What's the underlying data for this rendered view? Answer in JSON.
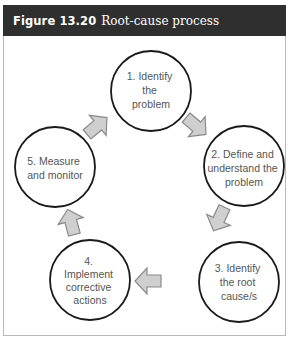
{
  "figure": {
    "label": "Figure 13.20",
    "title": "Root-cause process"
  },
  "colors": {
    "header_bg": "#2f2f2f",
    "header_text": "#ffffff",
    "circle_stroke": "#1a1a1a",
    "arrow_fill": "#cfcfcf",
    "arrow_stroke": "#8a8a8a",
    "node_text": "#555555"
  },
  "nodes": [
    {
      "id": 1,
      "lines": [
        "1. Identify",
        "the",
        "problem"
      ]
    },
    {
      "id": 2,
      "lines": [
        "2. Define and",
        "understand the",
        "problem"
      ]
    },
    {
      "id": 3,
      "lines": [
        "3. Identify",
        "the root",
        "cause/s"
      ]
    },
    {
      "id": 4,
      "lines": [
        "4.",
        "Implement",
        "corrective",
        "actions"
      ]
    },
    {
      "id": 5,
      "lines": [
        "5. Measure",
        "and monitor"
      ]
    }
  ],
  "arrows": [
    {
      "from": 1,
      "to": 2
    },
    {
      "from": 2,
      "to": 3
    },
    {
      "from": 3,
      "to": 4
    },
    {
      "from": 4,
      "to": 5
    },
    {
      "from": 5,
      "to": 1
    }
  ]
}
